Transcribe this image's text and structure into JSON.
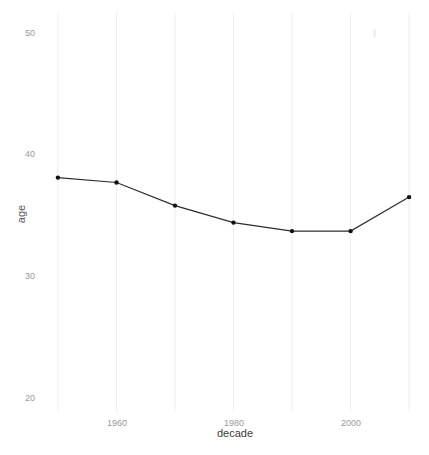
{
  "figure": {
    "background": "#ffffff"
  },
  "chart_data": {
    "type": "line",
    "title": "",
    "xlabel": "decade",
    "ylabel": "age",
    "x": [
      1950,
      1960,
      1970,
      1980,
      1990,
      2000,
      2010
    ],
    "y": [
      38.1,
      37.7,
      35.8,
      34.4,
      33.7,
      33.7,
      36.5
    ],
    "x_tick_labels": [
      "1960",
      "1980",
      "2000"
    ],
    "y_tick_labels": [
      "50",
      "40",
      "30",
      "20"
    ],
    "y_tick_values": [
      50,
      40,
      30,
      20
    ],
    "x_gridlines": [
      1950,
      1960,
      1970,
      1980,
      1990,
      2000,
      2010
    ],
    "xlim": [
      1940.1,
      2013.4
    ],
    "ylim": [
      15.3,
      52.7
    ],
    "grid": "vertical-only",
    "legend": "none",
    "line_color": "#2e2e2e",
    "point_color": "#111111",
    "point_radius": 2.2,
    "gridline_color": "#efefef",
    "tick_label_color": "#999999",
    "axis_title_color": "#404040"
  }
}
